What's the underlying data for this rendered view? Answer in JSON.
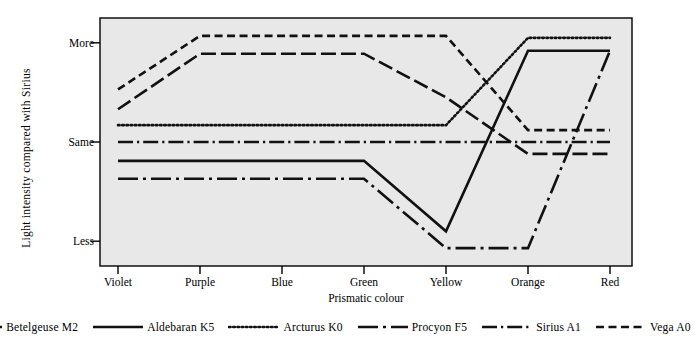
{
  "figure": {
    "plot_bg": "#e8e8e8",
    "frame_color": "#000000",
    "line_color": "#111111"
  },
  "chart_data": {
    "type": "line",
    "title": "",
    "xlabel": "Prismatic colour",
    "ylabel": "Light intensity compared with Sirius",
    "categories": [
      "Violet",
      "Purple",
      "Blue",
      "Green",
      "Yellow",
      "Orange",
      "Red"
    ],
    "ytick_labels": [
      "More",
      "Same",
      "Less"
    ],
    "ytick_values": [
      1,
      0,
      -1
    ],
    "ylim": [
      -1.25,
      1.25
    ],
    "grid": false,
    "legend_position": "bottom",
    "series": [
      {
        "name": "Betelgeuse M2",
        "style": "long-dash",
        "values": [
          0.33,
          0.89,
          0.89,
          0.89,
          0.45,
          -0.12,
          -0.12
        ]
      },
      {
        "name": "Aldebaran K5",
        "style": "solid",
        "values": [
          -0.19,
          -0.19,
          -0.19,
          -0.19,
          -0.9,
          0.92,
          0.92
        ]
      },
      {
        "name": "Arcturus K0",
        "style": "dotted",
        "values": [
          0.17,
          0.17,
          0.17,
          0.17,
          0.17,
          1.05,
          1.05
        ]
      },
      {
        "name": "Procyon F5",
        "style": "dash-dot-long",
        "values": [
          -0.37,
          -0.37,
          -0.37,
          -0.37,
          -1.07,
          -1.07,
          0.92
        ]
      },
      {
        "name": "Sirius A1",
        "style": "dash-dot",
        "values": [
          0.0,
          0.0,
          0.0,
          0.0,
          0.0,
          0.0,
          0.0
        ]
      },
      {
        "name": "Vega A0",
        "style": "dash",
        "values": [
          0.53,
          1.07,
          1.07,
          1.07,
          1.07,
          0.12,
          0.12
        ]
      }
    ]
  },
  "legend": [
    {
      "label": "Betelgeuse M2",
      "style": "long-dash"
    },
    {
      "label": "Aldebaran K5",
      "style": "solid"
    },
    {
      "label": "Arcturus K0",
      "style": "dotted"
    },
    {
      "label": "Procyon F5",
      "style": "dash-dot-long"
    },
    {
      "label": "Sirius A1",
      "style": "dash-dot"
    },
    {
      "label": "Vega A0",
      "style": "dash"
    }
  ]
}
